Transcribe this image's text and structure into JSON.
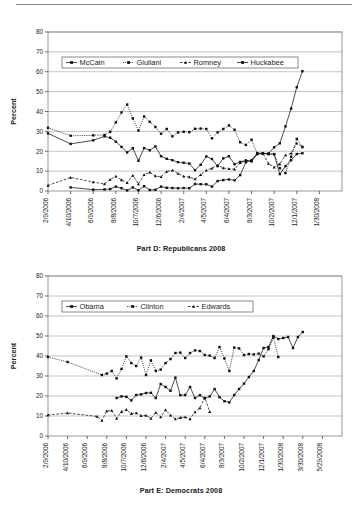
{
  "document": {
    "has_top_rule": true,
    "background": "#ffffff",
    "ink": "#111111"
  },
  "figures": [
    {
      "id": "figure-d",
      "caption": "Part D: Republicans 2008"
    },
    {
      "id": "figure-e",
      "caption": "Part E: Democrats 2008"
    }
  ],
  "chart_data": [
    {
      "type": "line",
      "title": "Part D: Republicans 2008",
      "xlabel": "",
      "ylabel": "Percent",
      "ylim": [
        0,
        80
      ],
      "ytick_step": 10,
      "yticks": [
        "0",
        "10",
        "20",
        "30",
        "40",
        "50",
        "60",
        "70",
        "80"
      ],
      "grid": true,
      "legend_position": "upper-left-inside",
      "xlim_index": [
        0,
        52
      ],
      "xtick_positions": [
        0,
        4,
        8,
        12,
        16,
        20,
        24,
        28,
        32,
        36,
        40,
        44,
        48
      ],
      "xtick_labels": [
        "2/9/2006",
        "4/10/2006",
        "6/9/2006",
        "8/8/2006",
        "10/7/2006",
        "12/6/2006",
        "2/4/2007",
        "4/5/2007",
        "6/4/2007",
        "8/3/2007",
        "10/2/2007",
        "12/1/2007",
        "1/30/2008"
      ],
      "series": [
        {
          "name": "McCain",
          "linestyle": "solid",
          "marker": "square",
          "values": [
            29,
            null,
            null,
            null,
            23.7,
            null,
            null,
            null,
            25.5,
            null,
            27.5,
            26.8,
            24.8,
            22.2,
            19.4,
            21.5,
            15.2,
            21.6,
            20.5,
            22.4,
            17.5,
            16.2,
            15.5,
            14.5,
            14.2,
            13.8,
            10.5,
            13.2,
            17.4,
            16.1,
            12.5,
            16.4,
            17.5,
            13.5,
            14.6,
            15.4,
            14.9,
            18.6,
            19,
            18.8,
            22,
            24,
            32.5,
            41.5,
            52.2,
            60.3
          ]
        },
        {
          "name": "Giuliani",
          "linestyle": "dotted",
          "marker": "square",
          "values": [
            31.8,
            null,
            null,
            null,
            27.8,
            null,
            null,
            null,
            28,
            null,
            28.2,
            29.8,
            34.5,
            39.5,
            43.5,
            36.5,
            30.4,
            37.5,
            34.8,
            32.2,
            28.8,
            31.2,
            27.5,
            29.5,
            29.8,
            29.6,
            31.3,
            31.4,
            31.2,
            26.5,
            29.5,
            31.2,
            33,
            30.8,
            24.5,
            23.2,
            25.8,
            19,
            18.8,
            18.5,
            18.6,
            11.5,
            9,
            17.2,
            26.2,
            22.2
          ]
        },
        {
          "name": "Romney",
          "linestyle": "dashed",
          "marker": "triangle",
          "values": [
            2.8,
            null,
            null,
            null,
            6.8,
            null,
            null,
            null,
            4.5,
            null,
            3.5,
            5.8,
            7.4,
            5.6,
            4.2,
            7.8,
            3.5,
            8.2,
            9.4,
            7.5,
            7.2,
            9.8,
            10.5,
            8.8,
            7.4,
            7,
            6,
            8.2,
            10.4,
            11.5,
            13,
            11.6,
            11.2,
            11,
            14.2,
            15.2,
            15.4,
            18.6,
            19,
            13.8,
            12,
            13.6,
            18,
            19,
            24,
            22.2
          ]
        },
        {
          "name": "Huckabee",
          "linestyle": "solid",
          "marker": "square",
          "values": [
            null,
            null,
            null,
            null,
            1.8,
            null,
            null,
            null,
            0.7,
            null,
            0.8,
            1,
            2.2,
            1.4,
            0.3,
            1.8,
            0.4,
            2.4,
            0.5,
            0.6,
            2.2,
            1.6,
            1.5,
            1.4,
            1.5,
            1.4,
            3.5,
            3.4,
            3.4,
            2.2,
            5,
            5.5,
            5.8,
            5.4,
            8,
            14.5,
            15.5,
            19,
            18.9,
            18.8,
            18.5,
            8.5,
            12.5,
            15.5,
            18.6,
            19
          ]
        }
      ]
    },
    {
      "type": "line",
      "title": "Part E: Democrats 2008",
      "xlabel": "",
      "ylabel": "Percent",
      "ylim": [
        0,
        80
      ],
      "ytick_step": 10,
      "yticks": [
        "0",
        "10",
        "20",
        "30",
        "40",
        "50",
        "60",
        "70",
        "80"
      ],
      "grid": true,
      "legend_position": "upper-left-inside",
      "xlim_index": [
        0,
        60
      ],
      "xtick_positions": [
        0,
        4,
        8,
        12,
        16,
        20,
        24,
        28,
        32,
        36,
        40,
        44,
        48,
        52,
        56
      ],
      "xtick_labels": [
        "2/9/2006",
        "4/10/2006",
        "6/9/2006",
        "8/8/2006",
        "10/7/2006",
        "12/6/2006",
        "2/4/2007",
        "4/5/2007",
        "6/4/2007",
        "8/3/2007",
        "10/2/2007",
        "12/1/2007",
        "1/30/2008",
        "3/30/2008",
        "5/29/2008"
      ],
      "series": [
        {
          "name": "Obama",
          "linestyle": "solid",
          "marker": "square",
          "values": [
            null,
            null,
            null,
            null,
            null,
            null,
            null,
            null,
            null,
            null,
            null,
            null,
            null,
            null,
            19,
            19.8,
            19.6,
            17.8,
            20.5,
            20.8,
            21.5,
            21.6,
            19,
            26,
            24.5,
            22.6,
            29.2,
            20.4,
            20.5,
            24.5,
            19,
            20.4,
            18.8,
            19.8,
            23.5,
            19.4,
            17.4,
            16.8,
            20.5,
            23.5,
            26.2,
            29.5,
            32.5,
            38,
            44,
            44.5,
            50,
            48.5,
            49,
            49.5,
            44,
            49.5,
            52
          ]
        },
        {
          "name": "Clinton",
          "linestyle": "dotted",
          "marker": "square",
          "values": [
            39.5,
            null,
            null,
            null,
            37,
            null,
            null,
            null,
            null,
            null,
            null,
            30.5,
            31.2,
            32.5,
            28.8,
            33.5,
            39.8,
            36.5,
            35,
            39.2,
            30.5,
            37.8,
            32.5,
            33.2,
            36.5,
            38.5,
            41.5,
            41.7,
            39,
            41.5,
            42.8,
            42.5,
            40.5,
            40.2,
            39,
            44.5,
            38.8,
            32.5,
            44.2,
            43.8,
            40.5,
            41,
            40.8,
            41.2,
            39.8,
            43.5,
            49.2,
            39.5
          ]
        },
        {
          "name": "Edwards",
          "linestyle": "dashed",
          "marker": "triangle",
          "values": [
            10.5,
            null,
            null,
            null,
            11.5,
            null,
            null,
            null,
            null,
            null,
            9.8,
            7.8,
            12.5,
            12.8,
            8.8,
            12.2,
            13.2,
            11.2,
            11.5,
            10.2,
            10.3,
            8.8,
            11.8,
            9.5,
            13,
            10.4,
            8.5,
            9.2,
            9.5,
            8.5,
            12,
            14,
            19.2,
            12.2
          ]
        }
      ]
    }
  ]
}
